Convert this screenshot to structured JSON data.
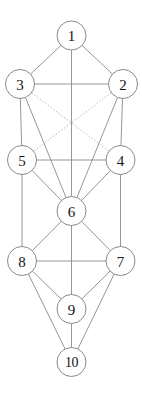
{
  "diagram": {
    "type": "node-link-graph",
    "canvas": {
      "width": 142,
      "height": 393,
      "background": "#ffffff"
    },
    "style": {
      "node_fill": "#ffffff",
      "node_stroke": "#7d7d7d",
      "label_color": "#151515",
      "solid_edge_color": "#8a8a8a",
      "dotted_edge_color": "#a8a8a8"
    },
    "nodes": [
      {
        "id": "n1",
        "label": "1",
        "cx": 71.5,
        "cy": 35.5,
        "r": 14.5
      },
      {
        "id": "n3",
        "label": "3",
        "cx": 20.0,
        "cy": 84.0,
        "r": 14.5
      },
      {
        "id": "n2",
        "label": "2",
        "cx": 123.0,
        "cy": 84.0,
        "r": 14.5
      },
      {
        "id": "n5",
        "label": "5",
        "cx": 22.0,
        "cy": 160.0,
        "r": 14.5
      },
      {
        "id": "n4",
        "label": "4",
        "cx": 120.5,
        "cy": 160.0,
        "r": 14.5
      },
      {
        "id": "n6",
        "label": "6",
        "cx": 71.5,
        "cy": 211.0,
        "r": 14.5
      },
      {
        "id": "n8",
        "label": "8",
        "cx": 22.0,
        "cy": 261.0,
        "r": 14.5
      },
      {
        "id": "n7",
        "label": "7",
        "cx": 120.5,
        "cy": 261.0,
        "r": 14.5
      },
      {
        "id": "n9",
        "label": "9",
        "cx": 71.5,
        "cy": 309.0,
        "r": 14.5
      },
      {
        "id": "n10",
        "label": "10",
        "cx": 71.5,
        "cy": 362.0,
        "r": 14.5
      }
    ],
    "edges": [
      {
        "from": "n1",
        "to": "n3",
        "style": "solid"
      },
      {
        "from": "n1",
        "to": "n2",
        "style": "solid"
      },
      {
        "from": "n1",
        "to": "n6",
        "style": "solid"
      },
      {
        "from": "n3",
        "to": "n2",
        "style": "solid"
      },
      {
        "from": "n3",
        "to": "n5",
        "style": "solid"
      },
      {
        "from": "n2",
        "to": "n4",
        "style": "solid"
      },
      {
        "from": "n3",
        "to": "n6",
        "style": "solid"
      },
      {
        "from": "n2",
        "to": "n6",
        "style": "solid"
      },
      {
        "from": "n3",
        "to": "n4",
        "style": "dotted"
      },
      {
        "from": "n2",
        "to": "n5",
        "style": "dotted"
      },
      {
        "from": "n5",
        "to": "n4",
        "style": "solid"
      },
      {
        "from": "n5",
        "to": "n6",
        "style": "solid"
      },
      {
        "from": "n4",
        "to": "n6",
        "style": "solid"
      },
      {
        "from": "n5",
        "to": "n8",
        "style": "solid"
      },
      {
        "from": "n4",
        "to": "n7",
        "style": "solid"
      },
      {
        "from": "n6",
        "to": "n8",
        "style": "solid"
      },
      {
        "from": "n6",
        "to": "n7",
        "style": "solid"
      },
      {
        "from": "n6",
        "to": "n9",
        "style": "solid"
      },
      {
        "from": "n8",
        "to": "n7",
        "style": "solid"
      },
      {
        "from": "n8",
        "to": "n9",
        "style": "solid"
      },
      {
        "from": "n7",
        "to": "n9",
        "style": "solid"
      },
      {
        "from": "n8",
        "to": "n10",
        "style": "solid"
      },
      {
        "from": "n7",
        "to": "n10",
        "style": "solid"
      },
      {
        "from": "n9",
        "to": "n10",
        "style": "solid"
      }
    ]
  }
}
